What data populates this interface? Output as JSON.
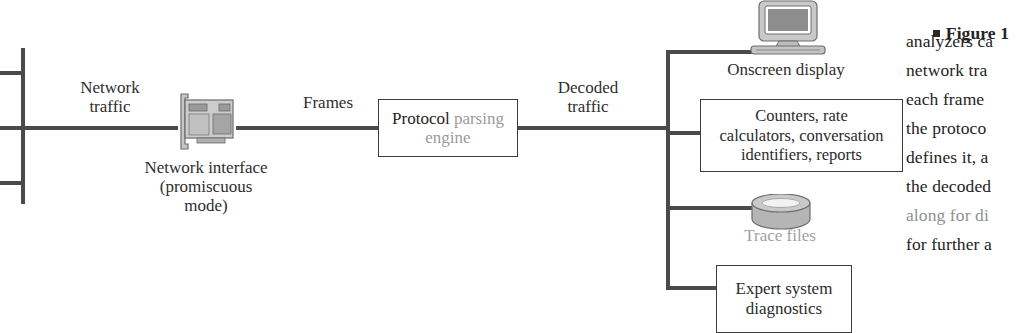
{
  "figure": {
    "edge_labels": {
      "network_traffic": "Network\ntraffic",
      "frames": "Frames",
      "decoded_traffic": "Decoded\ntraffic"
    },
    "nodes": {
      "network_backbone": "network-backbone",
      "nic": {
        "icon": "network-interface-card-icon",
        "label": "Network interface\n(promiscuous\nmode)"
      },
      "engine": {
        "label_strong": "Protocol",
        "label_light": "parsing\nengine"
      },
      "monitor": {
        "icon": "crt-monitor-icon",
        "label": "Onscreen display"
      },
      "counters": {
        "label": "Counters, rate\ncalculators, conversation\nidentifiers, reports"
      },
      "disk": {
        "icon": "disk-pack-icon",
        "label": "Trace files"
      },
      "expert": {
        "label": "Expert system\ndiagnostics"
      }
    },
    "colors": {
      "line": "#4a4a4a",
      "box_border": "#3d3d3d",
      "text": "#2b2b2b",
      "faded_text": "#9fa0a2",
      "device_fill": "#b9b9b9",
      "page": "#ffffff"
    }
  },
  "caption": {
    "marker": "■",
    "lines": [
      "Figure 1",
      "analyzers ca",
      "network tra",
      "each frame",
      "the protoco",
      "defines it, a",
      "the decoded",
      "along for di",
      "for further a"
    ],
    "faded_line_index": 7
  }
}
